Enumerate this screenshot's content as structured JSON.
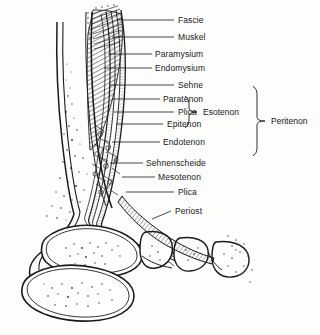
{
  "figure": {
    "style": "line-drawing",
    "ink_color": "#1a1a1a",
    "background_color": "#ffffff"
  },
  "labels": [
    {
      "id": "fascie",
      "text": "Fascie",
      "x": 178,
      "y": 20,
      "leader_x1": 118,
      "leader_y1": 20,
      "leader_x2": 174,
      "leader_y2": 20,
      "align": "left"
    },
    {
      "id": "muskel",
      "text": "Muskel",
      "x": 178,
      "y": 37,
      "leader_x1": 112,
      "leader_y1": 37,
      "leader_x2": 174,
      "leader_y2": 37,
      "align": "left"
    },
    {
      "id": "paramysium",
      "text": "Paramysium",
      "x": 155,
      "y": 54,
      "leader_x1": 108,
      "leader_y1": 54,
      "leader_x2": 152,
      "leader_y2": 54,
      "align": "left"
    },
    {
      "id": "endomysium",
      "text": "Endomysium",
      "x": 155,
      "y": 68,
      "leader_x1": 104,
      "leader_y1": 68,
      "leader_x2": 152,
      "leader_y2": 68,
      "align": "left"
    },
    {
      "id": "sehne",
      "text": "Sehne",
      "x": 178,
      "y": 85,
      "leader_x1": 110,
      "leader_y1": 85,
      "leader_x2": 174,
      "leader_y2": 85,
      "align": "left"
    },
    {
      "id": "paratenon",
      "text": "Paratenon",
      "x": 163,
      "y": 99,
      "leader_x1": 112,
      "leader_y1": 99,
      "leader_x2": 160,
      "leader_y2": 99,
      "align": "left"
    },
    {
      "id": "plica-1",
      "text": "Plica",
      "x": 178,
      "y": 112,
      "leader_x1": 114,
      "leader_y1": 112,
      "leader_x2": 174,
      "leader_y2": 112,
      "align": "left"
    },
    {
      "id": "epitenon",
      "text": "Epitenon",
      "x": 167,
      "y": 124,
      "leader_x1": 116,
      "leader_y1": 124,
      "leader_x2": 163,
      "leader_y2": 124,
      "align": "left"
    },
    {
      "id": "endotenon",
      "text": "Endotenon",
      "x": 163,
      "y": 142,
      "leader_x1": 112,
      "leader_y1": 142,
      "leader_x2": 160,
      "leader_y2": 142,
      "align": "left"
    },
    {
      "id": "sehnenscheide",
      "text": "Sehnenscheide",
      "x": 146,
      "y": 163,
      "leader_x1": 110,
      "leader_y1": 163,
      "leader_x2": 143,
      "leader_y2": 163,
      "align": "left"
    },
    {
      "id": "mesotenon",
      "text": "Mesotenon",
      "x": 158,
      "y": 177,
      "leader_x1": 122,
      "leader_y1": 177,
      "leader_x2": 155,
      "leader_y2": 177,
      "align": "left"
    },
    {
      "id": "plica-2",
      "text": "Plica",
      "x": 178,
      "y": 192,
      "leader_x1": 126,
      "leader_y1": 192,
      "leader_x2": 174,
      "leader_y2": 192,
      "align": "left"
    },
    {
      "id": "periost",
      "text": "Periost",
      "x": 175,
      "y": 211,
      "leader_x1": 152,
      "leader_y1": 219,
      "leader_x2": 171,
      "leader_y2": 211,
      "align": "left"
    }
  ],
  "brackets": [
    {
      "id": "esotenon",
      "text": "Esotenon",
      "label_x": 203,
      "label_y": 112,
      "spine_x": 189,
      "top_y": 96,
      "bottom_y": 128,
      "tip_x": 197
    },
    {
      "id": "peritenon",
      "text": "Peritenon",
      "label_x": 271,
      "label_y": 121,
      "spine_x": 257,
      "top_y": 86,
      "bottom_y": 156,
      "tip_x": 265
    }
  ],
  "anatomy": {
    "structures": [
      {
        "id": "tibia",
        "name": "Tibia (Schienbein) shaft with cortical bone and trabecular stippling"
      },
      {
        "id": "muscle-belly",
        "name": "Muscle belly with oblique fibre hatching"
      },
      {
        "id": "tendon-bands",
        "name": "Tendon with concentric sheath layers"
      },
      {
        "id": "tendon-sheath",
        "name": "Sehnenscheide (tendon sheath) layers"
      },
      {
        "id": "talus",
        "name": "Talus bone"
      },
      {
        "id": "calcaneus",
        "name": "Calcaneus bone"
      },
      {
        "id": "tarsal-bones",
        "name": "Tarsal bone row"
      },
      {
        "id": "periosteum-layer",
        "name": "Periosteum wrapping the bones"
      }
    ]
  }
}
